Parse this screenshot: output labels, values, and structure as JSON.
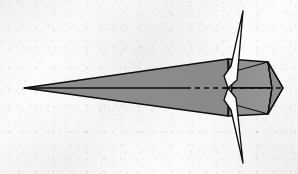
{
  "figure": {
    "domain": "diagram",
    "canvas": {
      "width": 298,
      "height": 174
    },
    "background": {
      "color": "#f7f7f7",
      "texture": "mottled-paper-scan"
    },
    "style": {
      "outline_color": "#0d0d0d",
      "outline_width": 1.4,
      "crease_color": "#111111",
      "crease_width": 1.0,
      "body_fill": "#8c8c8c",
      "panel_fill_light": "#9a9a9a",
      "panel_fill_dark": "#7e7e7e",
      "fin_fill": "#fcfcfc",
      "centerline_color": "#0d0d0d"
    },
    "axis": {
      "centerline_y": 88,
      "solid_from_x": 24,
      "solid_to_x": 186,
      "dashed_from_x": 186,
      "dashed_to_x": 283,
      "dash_pattern": "5,4"
    },
    "parts": [
      {
        "id": "nose-wedge",
        "label": "Forward tapered nose wedge",
        "fill": "#8c8c8c",
        "points": "24,88 228,59 228,116"
      },
      {
        "id": "upper-rear-panel",
        "label": "Upper rear faceted panel",
        "fill": "#9a9a9a",
        "points": "228,59 268,62 272,88 232,88"
      },
      {
        "id": "lower-rear-panel",
        "label": "Lower rear faceted panel",
        "fill": "#9a9a9a",
        "points": "232,88 272,88 268,114 228,116"
      },
      {
        "id": "tail-cone",
        "label": "Rear tail cone point",
        "fill": "#8e8e8e",
        "points": "268,62 283,88 268,114 272,88"
      },
      {
        "id": "upper-fin",
        "label": "Upper vertical fin blade",
        "fill": "#fcfcfc",
        "points": "243,11 237,80 228,88 224,76 231,66"
      },
      {
        "id": "lower-fin",
        "label": "Lower vertical fin blade",
        "fill": "#fcfcfc",
        "points": "243,163 236,98 228,88 224,100 231,110"
      }
    ],
    "creases": [
      {
        "id": "crease-upper-diagonal",
        "label": "Upper panel diagonal crease",
        "d": "M 232,72 L 268,62"
      },
      {
        "id": "crease-lower-diagonal",
        "label": "Lower panel diagonal crease",
        "d": "M 232,104 L 268,114"
      },
      {
        "id": "crease-upper-rear-edge",
        "label": "Upper tail cone fold",
        "d": "M 268,62 L 272,88"
      },
      {
        "id": "crease-lower-rear-edge",
        "label": "Lower tail cone fold",
        "d": "M 272,88 L 268,114"
      },
      {
        "id": "crease-nose-upper",
        "label": "Nose upper fold edge",
        "d": "M 24,88 L 228,59"
      },
      {
        "id": "crease-nose-lower",
        "label": "Nose lower fold edge",
        "d": "M 24,88 L 228,116"
      }
    ],
    "annotations": {
      "centerline_name": "longitudinal axis",
      "visible_labels": []
    }
  }
}
